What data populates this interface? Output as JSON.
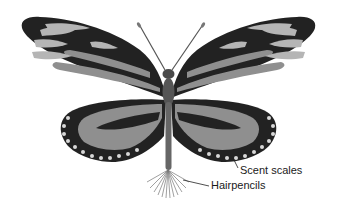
{
  "figure": {
    "colors": {
      "wing_dark": "#222222",
      "wing_band": "#8f8f8f",
      "wing_light_spot": "#b5b5b5",
      "hind_spots": "#d8d8d8",
      "body": "#4a4a4a",
      "hairpencils": "#777777",
      "leader_line": "#222222"
    }
  },
  "labels": {
    "scent_scales": "Scent scales",
    "hairpencils": "Hairpencils"
  }
}
